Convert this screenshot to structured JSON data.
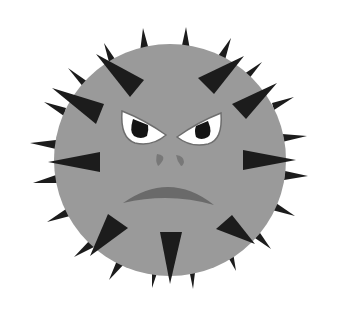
{
  "image": {
    "subject": "angry spiky virus ball",
    "description": "Grayscale illustration of a round gray ball covered in black triangular spikes with an angry face: furrowed white eyes with black pupils, two small nostrils and a downturned frowning mouth."
  },
  "colors": {
    "background": "#ffffff",
    "body": "#9a9a9a",
    "spike": "#1c1c1c",
    "eye_white": "#ffffff",
    "pupil": "#141414",
    "eye_outline": "#6e6e6e",
    "nose": "#787878",
    "mouth": "#6a6a6a"
  }
}
